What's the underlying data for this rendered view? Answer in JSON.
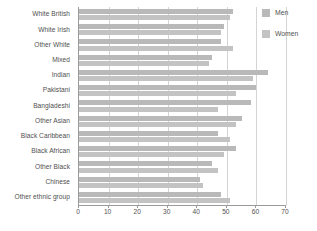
{
  "chart_data": {
    "type": "bar",
    "orientation": "horizontal",
    "title": "",
    "subtitle": "",
    "xlabel": "",
    "ylabel": "",
    "xlim": [
      0,
      70
    ],
    "xticks": [
      0,
      10,
      20,
      30,
      40,
      50,
      60,
      70
    ],
    "grid": true,
    "legend_position": "top-right",
    "categories": [
      "White British",
      "White Irish",
      "Other White",
      "Mixed",
      "Indian",
      "Pakistani",
      "Bangladeshi",
      "Other Asian",
      "Black Caribbean",
      "Black African",
      "Other Black",
      "Chinese",
      "Other ethnic group"
    ],
    "series": [
      {
        "name": "Men",
        "color": "#b9b9b9",
        "values": [
          52,
          49,
          48,
          45,
          64,
          60,
          58,
          55,
          47,
          53,
          45,
          41,
          48
        ]
      },
      {
        "name": "Women",
        "color": "#c3c3c3",
        "values": [
          51,
          48,
          52,
          44,
          59,
          53,
          47,
          53,
          51,
          49,
          47,
          42,
          51
        ]
      }
    ]
  },
  "legend": {
    "items": [
      {
        "label": "Men",
        "swatch": "men-swatch"
      },
      {
        "label": "Women",
        "swatch": "women-swatch"
      }
    ]
  },
  "axis": {
    "x_tick_labels": [
      "0",
      "10",
      "20",
      "30",
      "40",
      "50",
      "60",
      "70"
    ]
  },
  "colors": {
    "bar_men": "#b9b9b9",
    "bar_women": "#c3c3c3",
    "grid": "#d4d4d4",
    "axis": "#9a9a9a",
    "text": "#4f4f4f",
    "background": "#ffffff"
  }
}
